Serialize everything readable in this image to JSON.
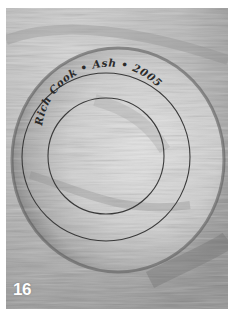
{
  "photo": {
    "subject": "turned wooden bowl base with engraved signature rings",
    "inscription": "Rich Cook • Ash • 2005",
    "plate_number": "16",
    "palette": {
      "light": "#e6e6e6",
      "mid": "#b8b8b8",
      "dark": "#6f6f6f",
      "ring_line": "#3a3a3a",
      "text_ink": "#2a2a2a",
      "number_color": "#ffffff"
    }
  }
}
